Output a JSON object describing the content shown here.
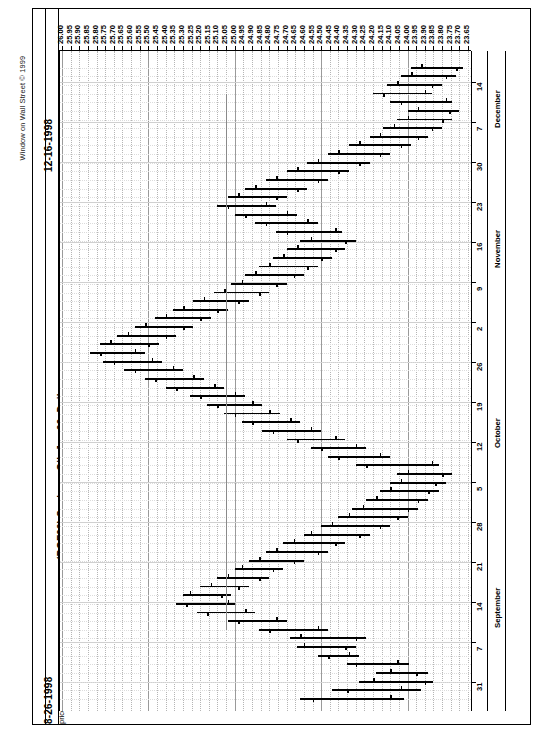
{
  "meta": {
    "copyright": "Window on Wall Street © 1999",
    "start_date": "8-26-1998",
    "end_date": "12-16-1998",
    "symbol_title": "(BOF99)  Soybean Oil, Jan 99, Daily",
    "study_line": "price(soybean oil, jan 99, daily d)  tdst (soybean oil, jan 99, daily)"
  },
  "chart_data": {
    "type": "bar",
    "title": "(BOF99)  Soybean Oil, Jan 99, Daily",
    "subtitle": "price(soybean oil, jan 99, daily d)  tdst (soybean oil, jan 99, daily)",
    "orientation": "rotated-90ccw",
    "xlabel": "Date",
    "ylabel": "Price (cents/lb)",
    "ylim": [
      23.65,
      26.0
    ],
    "price_step": 0.05,
    "grid": true,
    "legend": "none",
    "price_ticks": [
      "26.00",
      "25.95",
      "25.90",
      "25.85",
      "25.80",
      "25.75",
      "25.70",
      "25.65",
      "25.60",
      "25.55",
      "25.50",
      "25.45",
      "25.40",
      "25.35",
      "25.30",
      "25.25",
      "25.20",
      "25.15",
      "25.10",
      "25.05",
      "25.00",
      "24.95",
      "24.90",
      "24.85",
      "24.80",
      "24.75",
      "24.70",
      "24.65",
      "24.60",
      "24.55",
      "24.50",
      "24.45",
      "24.40",
      "24.35",
      "24.30",
      "24.25",
      "24.20",
      "24.15",
      "24.10",
      "24.05",
      "24.00",
      "23.95",
      "23.90",
      "23.85",
      "23.80",
      "23.75",
      "23.70",
      "23.65"
    ],
    "date_ticks": [
      {
        "label": "31",
        "month": "September"
      },
      {
        "label": "7",
        "month": "September"
      },
      {
        "label": "14",
        "month": "September"
      },
      {
        "label": "21",
        "month": "September"
      },
      {
        "label": "28",
        "month": "September"
      },
      {
        "label": "5",
        "month": "October"
      },
      {
        "label": "12",
        "month": "October"
      },
      {
        "label": "19",
        "month": "October"
      },
      {
        "label": "26",
        "month": "October"
      },
      {
        "label": "2",
        "month": "November"
      },
      {
        "label": "9",
        "month": "November"
      },
      {
        "label": "16",
        "month": "November"
      },
      {
        "label": "23",
        "month": "November"
      },
      {
        "label": "30",
        "month": "November"
      },
      {
        "label": "7",
        "month": "December"
      },
      {
        "label": "14",
        "month": "December"
      }
    ],
    "months": [
      "September",
      "October",
      "November",
      "December"
    ],
    "series_name": "Soybean Oil Jan 99 OHLC",
    "bars": [
      {
        "i": 0,
        "high": 24.62,
        "low": 24.02,
        "open": 24.1,
        "close": 24.55
      },
      {
        "i": 1,
        "high": 24.44,
        "low": 23.92,
        "open": 24.04,
        "close": 24.35
      },
      {
        "i": 2,
        "high": 24.28,
        "low": 23.85,
        "open": 24.2,
        "close": 23.9
      },
      {
        "i": 3,
        "high": 24.18,
        "low": 23.88,
        "open": 24.1,
        "close": 23.95
      },
      {
        "i": 4,
        "high": 24.35,
        "low": 23.99,
        "open": 24.06,
        "close": 24.3
      },
      {
        "i": 5,
        "high": 24.52,
        "low": 24.28,
        "open": 24.34,
        "close": 24.46
      },
      {
        "i": 6,
        "high": 24.64,
        "low": 24.3,
        "open": 24.6,
        "close": 24.36
      },
      {
        "i": 7,
        "high": 24.68,
        "low": 24.24,
        "open": 24.62,
        "close": 24.3
      },
      {
        "i": 8,
        "high": 24.86,
        "low": 24.46,
        "open": 24.52,
        "close": 24.8
      },
      {
        "i": 9,
        "high": 25.04,
        "low": 24.7,
        "open": 24.76,
        "close": 24.98
      },
      {
        "i": 10,
        "high": 25.22,
        "low": 24.88,
        "open": 24.94,
        "close": 25.16
      },
      {
        "i": 11,
        "high": 25.34,
        "low": 25.0,
        "open": 25.04,
        "close": 25.28
      },
      {
        "i": 12,
        "high": 25.3,
        "low": 25.02,
        "open": 25.26,
        "close": 25.08
      },
      {
        "i": 13,
        "high": 25.2,
        "low": 24.92,
        "open": 25.14,
        "close": 24.98
      },
      {
        "i": 14,
        "high": 25.1,
        "low": 24.8,
        "open": 25.04,
        "close": 24.86
      },
      {
        "i": 15,
        "high": 25.0,
        "low": 24.72,
        "open": 24.96,
        "close": 24.78
      },
      {
        "i": 16,
        "high": 24.92,
        "low": 24.6,
        "open": 24.86,
        "close": 24.66
      },
      {
        "i": 17,
        "high": 24.82,
        "low": 24.46,
        "open": 24.76,
        "close": 24.52
      },
      {
        "i": 18,
        "high": 24.72,
        "low": 24.36,
        "open": 24.66,
        "close": 24.42
      },
      {
        "i": 19,
        "high": 24.6,
        "low": 24.22,
        "open": 24.56,
        "close": 24.28
      },
      {
        "i": 20,
        "high": 24.5,
        "low": 24.1,
        "open": 24.44,
        "close": 24.16
      },
      {
        "i": 21,
        "high": 24.4,
        "low": 24.0,
        "open": 24.34,
        "close": 24.06
      },
      {
        "i": 22,
        "high": 24.32,
        "low": 23.94,
        "open": 24.26,
        "close": 24.0
      },
      {
        "i": 23,
        "high": 24.24,
        "low": 23.88,
        "open": 24.18,
        "close": 23.94
      },
      {
        "i": 24,
        "high": 24.16,
        "low": 23.82,
        "open": 24.1,
        "close": 23.88
      },
      {
        "i": 25,
        "high": 24.1,
        "low": 23.78,
        "open": 24.04,
        "close": 23.84
      },
      {
        "i": 26,
        "high": 24.06,
        "low": 23.74,
        "open": 24.0,
        "close": 23.8
      },
      {
        "i": 27,
        "high": 24.3,
        "low": 23.82,
        "open": 23.86,
        "close": 24.24
      },
      {
        "i": 28,
        "high": 24.46,
        "low": 24.1,
        "open": 24.16,
        "close": 24.4
      },
      {
        "i": 29,
        "high": 24.56,
        "low": 24.24,
        "open": 24.3,
        "close": 24.5
      },
      {
        "i": 30,
        "high": 24.7,
        "low": 24.36,
        "open": 24.42,
        "close": 24.64
      },
      {
        "i": 31,
        "high": 24.84,
        "low": 24.5,
        "open": 24.56,
        "close": 24.78
      },
      {
        "i": 32,
        "high": 24.96,
        "low": 24.62,
        "open": 24.68,
        "close": 24.9
      },
      {
        "i": 33,
        "high": 25.06,
        "low": 24.74,
        "open": 24.8,
        "close": 25.0
      },
      {
        "i": 34,
        "high": 25.16,
        "low": 24.84,
        "open": 24.9,
        "close": 25.1
      },
      {
        "i": 35,
        "high": 25.26,
        "low": 24.94,
        "open": 25.0,
        "close": 25.2
      },
      {
        "i": 36,
        "high": 25.4,
        "low": 25.06,
        "open": 25.12,
        "close": 25.34
      },
      {
        "i": 37,
        "high": 25.52,
        "low": 25.18,
        "open": 25.24,
        "close": 25.46
      },
      {
        "i": 38,
        "high": 25.64,
        "low": 25.3,
        "open": 25.36,
        "close": 25.58
      },
      {
        "i": 39,
        "high": 25.76,
        "low": 25.42,
        "open": 25.48,
        "close": 25.7
      },
      {
        "i": 40,
        "high": 25.84,
        "low": 25.52,
        "open": 25.58,
        "close": 25.78
      },
      {
        "i": 41,
        "high": 25.78,
        "low": 25.44,
        "open": 25.72,
        "close": 25.5
      },
      {
        "i": 42,
        "high": 25.68,
        "low": 25.34,
        "open": 25.62,
        "close": 25.4
      },
      {
        "i": 43,
        "high": 25.58,
        "low": 25.24,
        "open": 25.52,
        "close": 25.3
      },
      {
        "i": 44,
        "high": 25.46,
        "low": 25.14,
        "open": 25.4,
        "close": 25.2
      },
      {
        "i": 45,
        "high": 25.36,
        "low": 25.04,
        "open": 25.3,
        "close": 25.1
      },
      {
        "i": 46,
        "high": 25.24,
        "low": 24.92,
        "open": 25.18,
        "close": 24.98
      },
      {
        "i": 47,
        "high": 25.12,
        "low": 24.8,
        "open": 25.06,
        "close": 24.86
      },
      {
        "i": 48,
        "high": 25.02,
        "low": 24.7,
        "open": 24.96,
        "close": 24.76
      },
      {
        "i": 49,
        "high": 24.94,
        "low": 24.6,
        "open": 24.88,
        "close": 24.66
      },
      {
        "i": 50,
        "high": 24.86,
        "low": 24.52,
        "open": 24.8,
        "close": 24.58
      },
      {
        "i": 51,
        "high": 24.78,
        "low": 24.44,
        "open": 24.72,
        "close": 24.5
      },
      {
        "i": 52,
        "high": 24.7,
        "low": 24.36,
        "open": 24.64,
        "close": 24.42
      },
      {
        "i": 53,
        "high": 24.62,
        "low": 24.3,
        "open": 24.56,
        "close": 24.36
      },
      {
        "i": 54,
        "high": 24.76,
        "low": 24.38,
        "open": 24.42,
        "close": 24.7
      },
      {
        "i": 55,
        "high": 24.88,
        "low": 24.52,
        "open": 24.58,
        "close": 24.82
      },
      {
        "i": 56,
        "high": 25.0,
        "low": 24.64,
        "open": 24.7,
        "close": 24.94
      },
      {
        "i": 57,
        "high": 25.1,
        "low": 24.76,
        "open": 24.82,
        "close": 25.04
      },
      {
        "i": 58,
        "high": 25.04,
        "low": 24.7,
        "open": 24.98,
        "close": 24.76
      },
      {
        "i": 59,
        "high": 24.94,
        "low": 24.58,
        "open": 24.88,
        "close": 24.64
      },
      {
        "i": 60,
        "high": 24.82,
        "low": 24.46,
        "open": 24.76,
        "close": 24.52
      },
      {
        "i": 61,
        "high": 24.7,
        "low": 24.34,
        "open": 24.64,
        "close": 24.4
      },
      {
        "i": 62,
        "high": 24.58,
        "low": 24.22,
        "open": 24.52,
        "close": 24.28
      },
      {
        "i": 63,
        "high": 24.46,
        "low": 24.1,
        "open": 24.4,
        "close": 24.16
      },
      {
        "i": 64,
        "high": 24.34,
        "low": 23.98,
        "open": 24.28,
        "close": 24.04
      },
      {
        "i": 65,
        "high": 24.22,
        "low": 23.88,
        "open": 24.16,
        "close": 23.94
      },
      {
        "i": 66,
        "high": 24.14,
        "low": 23.8,
        "open": 24.08,
        "close": 23.86
      },
      {
        "i": 67,
        "high": 24.06,
        "low": 23.74,
        "open": 24.0,
        "close": 23.8
      },
      {
        "i": 68,
        "high": 24.0,
        "low": 23.7,
        "open": 23.94,
        "close": 23.76
      },
      {
        "i": 69,
        "high": 24.1,
        "low": 23.74,
        "open": 23.78,
        "close": 24.04
      },
      {
        "i": 70,
        "high": 24.2,
        "low": 23.86,
        "open": 23.9,
        "close": 24.14
      },
      {
        "i": 71,
        "high": 24.12,
        "low": 23.8,
        "open": 24.06,
        "close": 23.86
      },
      {
        "i": 72,
        "high": 24.04,
        "low": 23.72,
        "open": 23.98,
        "close": 23.78
      },
      {
        "i": 73,
        "high": 23.98,
        "low": 23.68,
        "open": 23.92,
        "close": 23.72
      }
    ],
    "stop_line": {
      "name": "tdst",
      "value": 25.05,
      "color": "#8a8a8a"
    }
  }
}
